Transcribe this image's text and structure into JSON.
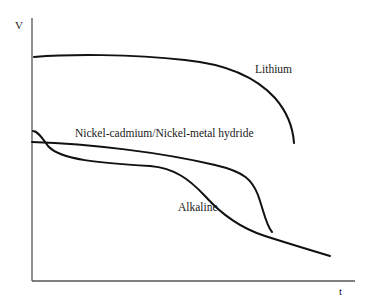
{
  "chart_data": {
    "type": "line",
    "title": "",
    "xlabel": "t",
    "ylabel": "V",
    "grid": false,
    "legend": "inline labels",
    "x_ticks": [],
    "y_ticks": [],
    "series": [
      {
        "name": "Lithium",
        "description": "Flat high voltage, then sharp drop at end of discharge",
        "points": [
          [
            0.0,
            0.85
          ],
          [
            0.2,
            0.86
          ],
          [
            0.47,
            0.84
          ],
          [
            0.66,
            0.78
          ],
          [
            0.77,
            0.67
          ],
          [
            0.81,
            0.52
          ]
        ],
        "path": "M34,57 C70,54 130,54 185,60 C225,64 255,76 275,98 C288,113 293,128 294,143",
        "label_pos": [
          255,
          73
        ]
      },
      {
        "name": "Nickel-cadmium/Nickel-metal hydride",
        "description": "Moderate voltage, slowly declining plateau, then sharp drop",
        "points": [
          [
            0.0,
            0.53
          ],
          [
            0.21,
            0.51
          ],
          [
            0.47,
            0.46
          ],
          [
            0.67,
            0.38
          ],
          [
            0.71,
            0.29
          ],
          [
            0.74,
            0.18
          ]
        ],
        "path": "M32,142 C90,144 160,152 215,165 C245,172 252,180 258,195 C264,212 266,225 272,232",
        "label_pos": [
          75,
          137
        ]
      },
      {
        "name": "Alkaline",
        "description": "Initial bump then continuous gradual decline",
        "points": [
          [
            0.0,
            0.57
          ],
          [
            0.04,
            0.52
          ],
          [
            0.12,
            0.47
          ],
          [
            0.36,
            0.44
          ],
          [
            0.47,
            0.39
          ],
          [
            0.61,
            0.23
          ],
          [
            0.74,
            0.16
          ],
          [
            0.92,
            0.09
          ]
        ],
        "path": "M33,131 C38,131 42,138 48,146 C60,160 100,163 150,166 C175,168 190,180 205,196 C222,215 240,228 265,236 C290,244 310,250 330,256",
        "label_pos": [
          178,
          211
        ]
      }
    ],
    "axes": {
      "y_axis": {
        "x": 32,
        "y_top": 18,
        "y_bottom": 281
      },
      "x_axis": {
        "y": 281,
        "x_left": 32,
        "x_right": 355
      }
    }
  },
  "labels": {
    "y_axis": "V",
    "x_axis": "t",
    "lithium": "Lithium",
    "nicd": "Nickel-cadmium/Nickel-metal hydride",
    "alkaline": "Alkaline"
  }
}
